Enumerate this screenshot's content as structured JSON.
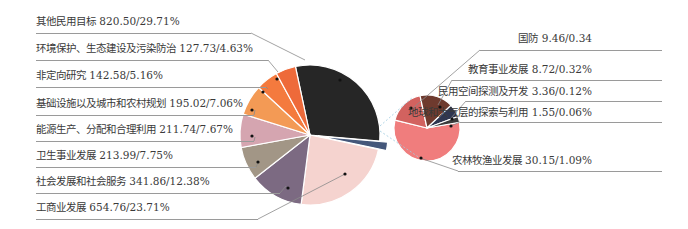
{
  "chart_data": {
    "type": "pie",
    "title": "",
    "subtype": "pie-of-pie",
    "unit_format": "value/percent",
    "main_pie": {
      "slices": [
        {
          "label": "其他民用目标",
          "value": 820.5,
          "percent": "29.71%",
          "color": "#262626"
        },
        {
          "label": "其余5项合计(分离扇区)",
          "value": 53.24,
          "percent": "1.93%",
          "color": "#44577a"
        },
        {
          "label": "工商业发展",
          "value": 654.76,
          "percent": "23.71%",
          "color": "#f5d3cf"
        },
        {
          "label": "社会发展和社会服务",
          "value": 341.86,
          "percent": "12.38%",
          "color": "#7c6a82"
        },
        {
          "label": "卫生事业发展",
          "value": 213.99,
          "percent": "7.75%",
          "color": "#a29686"
        },
        {
          "label": "能源生产、分配和合理利用",
          "value": 211.74,
          "percent": "7.67%",
          "color": "#d5a5b0"
        },
        {
          "label": "基础设施以及城市和农村规划",
          "value": 195.02,
          "percent": "7.06%",
          "color": "#f39a55"
        },
        {
          "label": "非定向研究",
          "value": 142.58,
          "percent": "5.16%",
          "color": "#f47a3e"
        },
        {
          "label": "环境保护、生态建设及污染防治",
          "value": 127.73,
          "percent": "4.63%",
          "color": "#ee6a3a"
        }
      ]
    },
    "secondary_pie": {
      "slices": [
        {
          "label": "农林牧渔业发展",
          "value": 30.15,
          "percent": "1.09%",
          "color": "#f07d7d"
        },
        {
          "label": "国防",
          "value": 9.46,
          "percent": "0.34",
          "color": "#d2625f"
        },
        {
          "label": "教育事业发展",
          "value": 8.72,
          "percent": "0.32%",
          "color": "#6e3a2e"
        },
        {
          "label": "民用空间探测及开发",
          "value": 3.36,
          "percent": "0.12%",
          "color": "#2f3650"
        },
        {
          "label": "地球和大气层的探索与利用",
          "value": 1.55,
          "percent": "0.06%",
          "color": "#3b3b3b"
        }
      ]
    },
    "legend_position": "callout-labels"
  },
  "labels": {
    "left": [
      "其他民用目标 820.50/29.71%",
      "环境保护、生态建设及污染防治 127.73/4.63%",
      "非定向研究 142.58/5.16%",
      "基础设施以及城市和农村规划 195.02/7.06%",
      "能源生产、分配和合理利用 211.74/7.67%",
      "卫生事业发展 213.99/7.75%",
      "社会发展和社会服务 341.86/12.38%",
      "工商业发展 654.76/23.71%"
    ],
    "right": [
      "国防 9.46/0.34",
      "教育事业发展 8.72/0.32%",
      "民用空间探测及开发 3.36/0.12%",
      "地球和大气层的探索与利用 1.55/0.06%",
      "农林牧渔业发展 30.15/1.09%"
    ]
  }
}
